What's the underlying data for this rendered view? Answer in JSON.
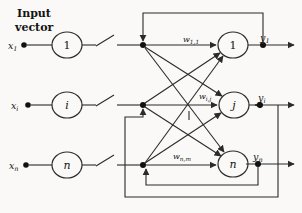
{
  "fig": {
    "title": {
      "line1": "Input",
      "line2": "vector"
    },
    "inputs": [
      {
        "label": {
          "base": "x",
          "sub": "1"
        },
        "node": "1"
      },
      {
        "label": {
          "base": "x",
          "sub": "i"
        },
        "node": "i"
      },
      {
        "label": {
          "base": "x",
          "sub": "n"
        },
        "node": "n"
      }
    ],
    "neurons": [
      "1",
      "j",
      "n"
    ],
    "weights": [
      {
        "base": "w",
        "sub": "1,1"
      },
      {
        "base": "w",
        "sub": "i,j"
      },
      {
        "base": "w",
        "sub": "n,m"
      }
    ],
    "outputs": [
      {
        "base": "y",
        "sub": "1"
      },
      {
        "base": "y",
        "sub": "i"
      },
      {
        "base": "y",
        "sub": "n"
      }
    ],
    "colors": {
      "line": "#2b2b2b",
      "background": "#faf9f7",
      "text": "#141414"
    }
  }
}
